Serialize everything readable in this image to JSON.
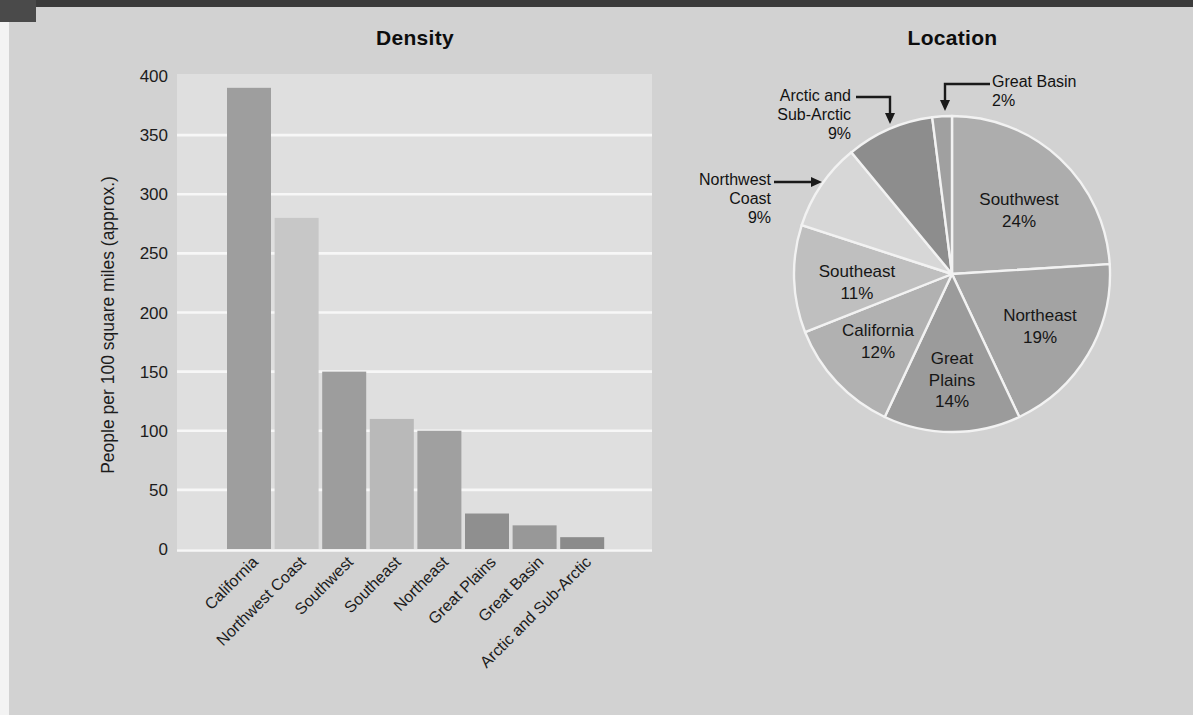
{
  "figure": {
    "density_title": "Density",
    "location_title": "Location"
  },
  "palette": {
    "page_background": "#d2d2d2",
    "plot_background": "#dfdfdf",
    "gridline": "#f7f7f7",
    "pie_separator": "#f2f2f2",
    "text": "#1c1c1c",
    "arrow": "#1a1a1a",
    "scan_edge_dark": "#3b3b3b",
    "scan_edge_light": "#f3f3f3"
  },
  "chart_data": [
    {
      "id": "density",
      "type": "bar",
      "title": "Density",
      "xlabel": "",
      "ylabel": "People per 100 square miles (approx.)",
      "categories": [
        "California",
        "Northwest Coast",
        "Southwest",
        "Southeast",
        "Northeast",
        "Great Plains",
        "Great Basin",
        "Arctic and Sub-Arctic"
      ],
      "values": [
        390,
        280,
        150,
        110,
        100,
        30,
        20,
        10
      ],
      "bar_colors": [
        "#9e9e9e",
        "#c7c7c7",
        "#9d9d9d",
        "#b9b9b9",
        "#a0a0a0",
        "#8f8f8f",
        "#989898",
        "#8b8b8b"
      ],
      "ylim": [
        0,
        400
      ],
      "ytick_step": 50,
      "yticks": [
        0,
        50,
        100,
        150,
        200,
        250,
        300,
        350,
        400
      ],
      "grid": true,
      "legend": "none"
    },
    {
      "id": "location",
      "type": "pie",
      "title": "Location",
      "start_angle_deg": 0,
      "direction": "clockwise",
      "slices": [
        {
          "label": "Southwest",
          "value": 24,
          "pct_label": "24%",
          "color": "#adadad",
          "label_placement": "inside",
          "label_lines": [
            "Southwest"
          ],
          "label_x": 1019,
          "label_y": 205
        },
        {
          "label": "Northeast",
          "value": 19,
          "pct_label": "19%",
          "color": "#a3a3a3",
          "label_placement": "inside",
          "label_lines": [
            "Northeast"
          ],
          "label_x": 1040,
          "label_y": 321
        },
        {
          "label": "Great Plains",
          "value": 14,
          "pct_label": "14%",
          "color": "#9b9b9b",
          "label_placement": "inside",
          "label_lines": [
            "Great",
            "Plains"
          ],
          "label_x": 952,
          "label_y": 364
        },
        {
          "label": "California",
          "value": 12,
          "pct_label": "12%",
          "color": "#b1b1b1",
          "label_placement": "inside",
          "label_lines": [
            "California"
          ],
          "label_x": 878,
          "label_y": 336
        },
        {
          "label": "Southeast",
          "value": 11,
          "pct_label": "11%",
          "color": "#bfbfbf",
          "label_placement": "inside",
          "label_lines": [
            "Southeast"
          ],
          "label_x": 857,
          "label_y": 277
        },
        {
          "label": "Northwest Coast",
          "value": 9,
          "pct_label": "9%",
          "color": "#d7d7d7",
          "label_placement": "callout",
          "label_lines": [
            "Northwest",
            "Coast"
          ]
        },
        {
          "label": "Arctic and Sub-Arctic",
          "value": 9,
          "pct_label": "9%",
          "color": "#8d8d8d",
          "label_placement": "callout",
          "label_lines": [
            "Arctic and",
            "Sub-Arctic"
          ]
        },
        {
          "label": "Great Basin",
          "value": 2,
          "pct_label": "2%",
          "color": "#a0a0a0",
          "label_placement": "callout",
          "label_lines": [
            "Great Basin"
          ]
        }
      ]
    }
  ]
}
